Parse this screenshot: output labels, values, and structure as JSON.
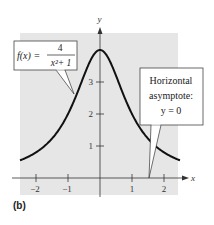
{
  "chart_data": {
    "type": "line",
    "title": "",
    "function": "f(x) = 4/(x^2+1)",
    "xlabel": "x",
    "ylabel": "y",
    "xlim": [
      -2.5,
      2.5
    ],
    "ylim": [
      -0.5,
      4.5
    ],
    "x_ticks": [
      -2,
      -1,
      1,
      2
    ],
    "x_tick_labels": [
      "−2",
      "−1",
      "1",
      "2"
    ],
    "y_ticks": [
      1,
      2,
      3
    ],
    "y_tick_labels": [
      "1",
      "2",
      "3"
    ],
    "grid": false,
    "background": "#e8e8e8",
    "series": [
      {
        "name": "f(x) = 4/(x^2+1)",
        "x": [
          -2.5,
          -2,
          -1.5,
          -1,
          -0.5,
          0,
          0.5,
          1,
          1.5,
          2,
          2.5
        ],
        "y": [
          0.55,
          0.8,
          1.23,
          2.0,
          3.2,
          4.0,
          3.2,
          2.0,
          1.23,
          0.8,
          0.55
        ],
        "color": "#111111"
      }
    ],
    "annotations": [
      {
        "id": "function-label",
        "text_lhs": "f(x) =",
        "numerator": "4",
        "denominator": "x²+ 1",
        "points_to": [
          -0.7,
          2.7
        ]
      },
      {
        "id": "asymptote-label",
        "lines": [
          "Horizontal",
          "asymptote:",
          "y = 0"
        ],
        "points_to": [
          1.55,
          0
        ]
      }
    ]
  },
  "labels": {
    "x_axis": "x",
    "y_axis": "y",
    "subfigure": "(b)",
    "func_lhs": "f(x) =",
    "func_num": "4",
    "func_den": "x²+ 1",
    "asym_1": "Horizontal",
    "asym_2": "asymptote:",
    "asym_3": "y = 0",
    "xt0": "−2",
    "xt1": "−1",
    "xt2": "1",
    "xt3": "2",
    "yt0": "1",
    "yt1": "2",
    "yt2": "3"
  }
}
